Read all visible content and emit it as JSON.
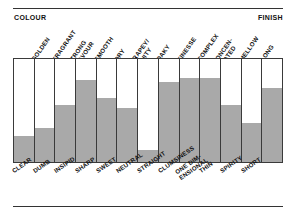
{
  "figure": {
    "left_caption": "COLOUR",
    "right_caption": "FINISH"
  },
  "chart_data": {
    "type": "bar",
    "title": "",
    "subtitle": "",
    "xlabel": "",
    "ylabel": "",
    "ylim": [
      0,
      100
    ],
    "grid": false,
    "legend": false,
    "orientation": "vertical",
    "axis_captions": {
      "top_left": "COLOUR",
      "top_right": "FINISH"
    },
    "colors": {
      "fill": "#a9a9a9",
      "empty": "#ffffff",
      "outline": "#3a3a3a",
      "text": "#121212"
    },
    "categories": [
      "CLEAR",
      "DUMB",
      "INSIPID",
      "SHARP",
      "SWEET",
      "NEUTRAL",
      "STRAIGHT",
      "CLUMSINESS",
      "ONE DIM-ENSIONAL",
      "THIN",
      "SPIRITY",
      "SHORT",
      ""
    ],
    "top_labels": [
      "",
      "GOLDEN",
      "FRAGRANT",
      "STRONG FLAVOUR",
      "SMOOTH",
      "DRY",
      "GRAPEY/ FRUITY",
      "OAKY",
      "FINESSE",
      "COMPLEX",
      "CONCEN- TRATED",
      "MELLOW",
      "LONG"
    ],
    "values": [
      25,
      33,
      55,
      80,
      62,
      52,
      12,
      78,
      82,
      82,
      55,
      38,
      72
    ]
  },
  "top_ticks": [
    {
      "line1": "GOLDEN",
      "line2": ""
    },
    {
      "line1": "FRAGRANT",
      "line2": ""
    },
    {
      "line1": "STRONG",
      "line2": "FLAVOUR"
    },
    {
      "line1": "SMOOTH",
      "line2": ""
    },
    {
      "line1": "DRY",
      "line2": ""
    },
    {
      "line1": "GRAPEY/",
      "line2": "FRUITY"
    },
    {
      "line1": "OAKY",
      "line2": ""
    },
    {
      "line1": "FINESSE",
      "line2": ""
    },
    {
      "line1": "COMPLEX",
      "line2": ""
    },
    {
      "line1": "CONCEN-",
      "line2": "TRATED"
    },
    {
      "line1": "MELLOW",
      "line2": ""
    },
    {
      "line1": "LONG",
      "line2": ""
    }
  ],
  "bottom_ticks": [
    {
      "line1": "CLEAR",
      "line2": ""
    },
    {
      "line1": "DUMB",
      "line2": ""
    },
    {
      "line1": "INSIPID",
      "line2": ""
    },
    {
      "line1": "SHARP",
      "line2": ""
    },
    {
      "line1": "SWEET",
      "line2": ""
    },
    {
      "line1": "NEUTRAL",
      "line2": ""
    },
    {
      "line1": "STRAIGHT",
      "line2": ""
    },
    {
      "line1": "CLUMSINESS",
      "line2": ""
    },
    {
      "line1": "ONE DIM-",
      "line2": "ENSIONAL"
    },
    {
      "line1": "THIN",
      "line2": ""
    },
    {
      "line1": "SPIRITY",
      "line2": ""
    },
    {
      "line1": "SHORT",
      "line2": ""
    }
  ]
}
